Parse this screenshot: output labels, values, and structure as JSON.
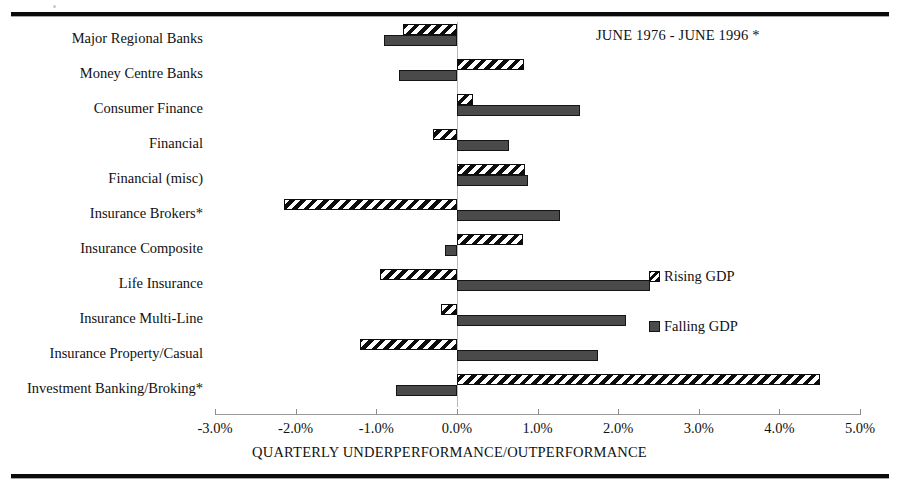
{
  "chart_data": {
    "type": "bar",
    "orientation": "horizontal",
    "title": "JUNE 1976 - JUNE 1996 *",
    "xlabel": "QUARTERLY UNDERPERFORMANCE/OUTPERFORMANCE",
    "ylabel": "",
    "xlim": [
      -3.0,
      5.0
    ],
    "xtick_labels": [
      "-3.0%",
      "-2.0%",
      "-1.0%",
      "0.0%",
      "1.0%",
      "2.0%",
      "3.0%",
      "4.0%",
      "5.0%"
    ],
    "xticks": [
      -3.0,
      -2.0,
      -1.0,
      0.0,
      1.0,
      2.0,
      3.0,
      4.0,
      5.0
    ],
    "grid": false,
    "legend_position": "center-right",
    "categories": [
      "Major Regional Banks",
      "Money Centre Banks",
      "Consumer Finance",
      "Financial",
      "Financial (misc)",
      "Insurance Brokers*",
      "Insurance Composite",
      "Life Insurance",
      "Insurance Multi-Line",
      "Insurance Property/Casual",
      "Investment Banking/Broking*"
    ],
    "series": [
      {
        "name": "Rising GDP",
        "pattern": "diagonal-hatch",
        "color": "#0d0d0d",
        "values": [
          -0.67,
          0.83,
          0.2,
          -0.3,
          0.85,
          -2.15,
          0.82,
          -0.95,
          -0.2,
          -1.2,
          4.5
        ]
      },
      {
        "name": "Falling GDP",
        "pattern": "solid",
        "color": "#4a4a4a",
        "values": [
          -0.9,
          -0.72,
          1.53,
          0.65,
          0.88,
          1.28,
          -0.15,
          2.4,
          2.1,
          1.75,
          -0.75
        ]
      }
    ]
  },
  "legend": {
    "items": [
      {
        "label": "Rising GDP",
        "style": "rising"
      },
      {
        "label": "Falling GDP",
        "style": "falling"
      }
    ]
  }
}
